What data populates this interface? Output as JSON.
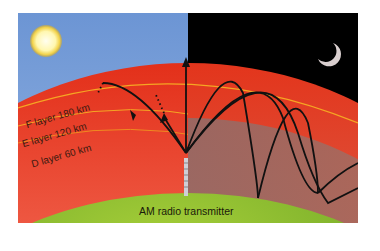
{
  "diagram": {
    "layers": [
      {
        "name": "F layer",
        "altitude": "180 km",
        "label": "F layer   180 km"
      },
      {
        "name": "E layer",
        "altitude": "120 km",
        "label": "E layer   120 km"
      },
      {
        "name": "D layer",
        "altitude": "60 km",
        "label": "D layer   60 km"
      }
    ],
    "transmitter_label": "AM radio transmitter",
    "day_side": {
      "icon": "sun-icon",
      "sky_color": "#6f97d6"
    },
    "night_side": {
      "icon": "moon-icon",
      "sky_color": "#000000"
    },
    "colors": {
      "ionosphere_outer": "#e8331a",
      "ionosphere_inner": "#f6b0b0",
      "layer_line": "#f5a623",
      "earth": "#7ab52a",
      "wave": "#111111"
    }
  }
}
